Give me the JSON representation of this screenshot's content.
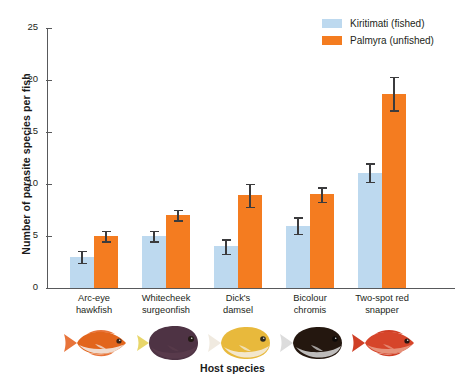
{
  "chart_data": {
    "type": "bar",
    "title": "",
    "xlabel": "Host species",
    "ylabel": "Number of parasite species per fish",
    "ylim": [
      0,
      25
    ],
    "yticks": [
      0,
      5,
      10,
      15,
      20,
      25
    ],
    "grid": false,
    "legend_position": "top-right",
    "categories": [
      "Arc-eye hawkfish",
      "Whitecheek surgeonfish",
      "Dick's damsel",
      "Bicolour chromis",
      "Two-spot red snapper"
    ],
    "category_lines": [
      [
        "Arc-eye",
        "hawkfish"
      ],
      [
        "Whitecheek",
        "surgeonfish"
      ],
      [
        "Dick's",
        "damsel"
      ],
      [
        "Bicolour",
        "chromis"
      ],
      [
        "Two-spot red",
        "snapper"
      ]
    ],
    "series": [
      {
        "name": "Kiritimati (fished)",
        "color": "#bdd9ef",
        "values": [
          3.0,
          5.0,
          4.0,
          6.0,
          11.1
        ],
        "errors": [
          0.6,
          0.5,
          0.7,
          0.8,
          0.9
        ]
      },
      {
        "name": "Palmyra (unfished)",
        "color": "#f47c20",
        "values": [
          5.0,
          7.0,
          8.9,
          9.0,
          18.7
        ],
        "errors": [
          0.5,
          0.5,
          1.1,
          0.7,
          1.6
        ]
      }
    ]
  },
  "legend": {
    "items": [
      {
        "label": "Kiritimati (fished)",
        "color": "#bdd9ef",
        "key": "kiritimati"
      },
      {
        "label": "Palmyra (unfished)",
        "color": "#f47c20",
        "key": "palmyra"
      }
    ]
  },
  "axes": {
    "y_title": "Number of parasite species per fish",
    "x_title": "Host species",
    "y_tick_labels": [
      "0",
      "5",
      "10",
      "15",
      "20",
      "25"
    ]
  },
  "fish_icons": [
    {
      "name": "arc-eye-hawkfish-illustration",
      "body": "#e2651c",
      "belly": "#f2f0ee",
      "fin": "#e8743a",
      "eye": "#3a2418",
      "shape": "elongate"
    },
    {
      "name": "whitecheek-surgeonfish-illustration",
      "body": "#4e3344",
      "belly": "#5a3c4c",
      "fin": "#e8d66a",
      "eye": "#231a14",
      "shape": "disc"
    },
    {
      "name": "dicks-damsel-illustration",
      "body": "#e8b93c",
      "belly": "#f4efe6",
      "fin": "#f0eae0",
      "eye": "#2e2a20",
      "shape": "oval"
    },
    {
      "name": "bicolour-chromis-illustration",
      "body": "#24170f",
      "belly": "#d9d9d9",
      "fin": "#dcdcdc",
      "eye": "#0d0a08",
      "shape": "oval"
    },
    {
      "name": "two-spot-red-snapper-illustration",
      "body": "#d6452a",
      "belly": "#e9a08a",
      "fin": "#cf3f26",
      "eye": "#2a1410",
      "shape": "elongate"
    }
  ]
}
